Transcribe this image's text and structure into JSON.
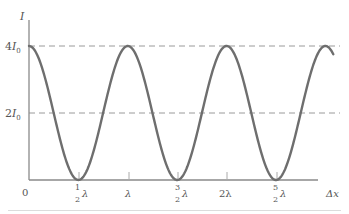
{
  "chart_data": {
    "type": "line",
    "title": "",
    "xlabel": "Δx",
    "ylabel": "I",
    "function": "I = 4 I0 cos^2(π Δx / λ)",
    "x_ticks": [
      "0",
      "1/2 λ",
      "λ",
      "3/2 λ",
      "2λ",
      "5/2 λ"
    ],
    "x_tick_values": [
      0,
      0.5,
      1.0,
      1.5,
      2.0,
      2.5
    ],
    "y_ticks": [
      "2I0",
      "4I0"
    ],
    "y_tick_values": [
      2,
      4
    ],
    "x": [
      0,
      0.25,
      0.5,
      0.75,
      1.0,
      1.25,
      1.5,
      1.75,
      2.0,
      2.25,
      2.5,
      2.75,
      3.0,
      3.08
    ],
    "values": [
      4,
      2,
      0,
      2,
      4,
      2,
      0,
      2,
      4,
      2,
      0,
      2,
      4,
      3.75
    ],
    "xlim": [
      0,
      3.1
    ],
    "ylim": [
      0,
      4.5
    ],
    "grid": false,
    "reference_lines": [
      {
        "y": 4,
        "style": "dashed",
        "label": "4I0"
      },
      {
        "y": 2,
        "style": "dashed",
        "label": "2I0"
      }
    ],
    "legend": null
  },
  "labels": {
    "y_axis": "I",
    "y_top": {
      "main": "4",
      "var": "I",
      "sub": "0"
    },
    "y_mid": {
      "main": "2",
      "var": "I",
      "sub": "0"
    },
    "origin": "0",
    "x_axis": "Δx",
    "lambda": "λ",
    "half_num": "1",
    "half_den": "2",
    "three_half_num": "3",
    "five_half_num": "5",
    "two_lambda": "2λ"
  },
  "colors": {
    "curve": "#6e6e6e",
    "axis": "#8a8a8a",
    "dashed": "#9a9a9a",
    "text": "#555555"
  }
}
